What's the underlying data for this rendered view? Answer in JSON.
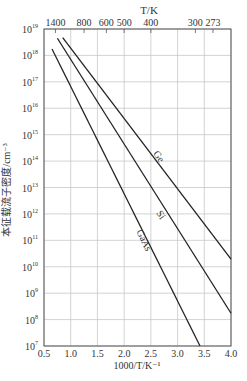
{
  "chart_data": {
    "type": "line",
    "title": "",
    "xlabel": "1000/T/K⁻¹",
    "ylabel": "本征载流子密度/cm⁻³",
    "top_xlabel": "T/K",
    "xlim": [
      0.5,
      4.0
    ],
    "ylim_log10": [
      7,
      19
    ],
    "yscale": "log",
    "grid": true,
    "x_ticks": [
      "0.5",
      "1.0",
      "1.5",
      "2.0",
      "2.5",
      "3.0",
      "3.5",
      "4.0"
    ],
    "x_tick_values": [
      0.5,
      1.0,
      1.5,
      2.0,
      2.5,
      3.0,
      3.5,
      4.0
    ],
    "y_tick_exponents": [
      7,
      8,
      9,
      10,
      11,
      12,
      13,
      14,
      15,
      16,
      17,
      18,
      19
    ],
    "top_ticks": [
      {
        "label": "1400",
        "x": 0.714
      },
      {
        "label": "800",
        "x": 1.25
      },
      {
        "label": "600",
        "x": 1.667
      },
      {
        "label": "500",
        "x": 2.0
      },
      {
        "label": "400",
        "x": 2.5
      },
      {
        "label": "300",
        "x": 3.333
      },
      {
        "label": "273",
        "x": 3.663
      }
    ],
    "series": [
      {
        "name": "Ge",
        "x": [
          0.85,
          4.0
        ],
        "log10_y": [
          18.67,
          10.29
        ],
        "label_at": [
          2.6,
          14.1
        ]
      },
      {
        "name": "Si",
        "x": [
          0.75,
          4.0
        ],
        "log10_y": [
          18.65,
          8.24
        ],
        "label_at": [
          2.64,
          11.9
        ]
      },
      {
        "name": "GaAs",
        "x": [
          0.65,
          3.42
        ],
        "log10_y": [
          18.24,
          7.0
        ],
        "label_at": [
          2.32,
          10.95
        ]
      }
    ],
    "legend": "none (inline labels)"
  }
}
